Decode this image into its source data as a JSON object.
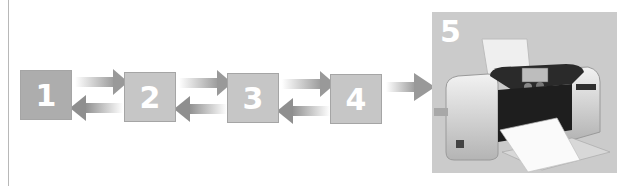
{
  "diagram": {
    "steps": [
      {
        "label": "1"
      },
      {
        "label": "2"
      },
      {
        "label": "3"
      },
      {
        "label": "4"
      },
      {
        "label": "5",
        "content": "photo printer"
      }
    ],
    "colors": {
      "box_dark": "#adadad",
      "box_light": "#c6c6c6",
      "arrow": "#9a9a9a",
      "panel": "#cbcbcb"
    }
  }
}
